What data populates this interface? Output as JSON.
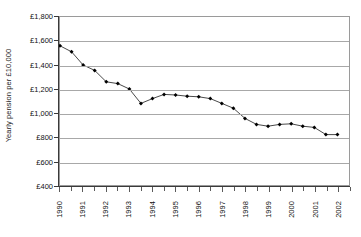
{
  "chart_data": {
    "type": "line",
    "title": "",
    "xlabel": "",
    "ylabel": "Yearly pension per £10,000",
    "ylim": [
      400,
      1800
    ],
    "ytick_labels": [
      "£1,800",
      "£1,600",
      "£1,400",
      "£1,200",
      "£1,000",
      "£800",
      "£600",
      "£400"
    ],
    "ytick_values": [
      1800,
      1600,
      1400,
      1200,
      1000,
      800,
      600,
      400
    ],
    "xtick_labels": [
      "1990",
      "1991",
      "1992",
      "1993",
      "1994",
      "1995",
      "1996",
      "1997",
      "1998",
      "1999",
      "2000",
      "2001",
      "2002"
    ],
    "xlim": [
      1990.0,
      2002.5
    ],
    "grid": "horizontal",
    "legend": "none",
    "marker": "filled-diamond",
    "line_color": "#333333",
    "marker_color": "#000000",
    "grid_color": "#a8a8a8",
    "x": [
      1990.0,
      1990.5,
      1991.0,
      1991.5,
      1992.0,
      1992.5,
      1993.0,
      1993.5,
      1994.0,
      1994.5,
      1995.0,
      1995.5,
      1996.0,
      1996.5,
      1997.0,
      1997.5,
      1998.0,
      1998.5,
      1999.0,
      1999.5,
      2000.0,
      2000.5,
      2001.0,
      2001.5,
      2002.0
    ],
    "values": [
      1560,
      1510,
      1400,
      1355,
      1260,
      1245,
      1200,
      1080,
      1120,
      1155,
      1150,
      1140,
      1135,
      1120,
      1080,
      1040,
      955,
      905,
      890,
      905,
      910,
      890,
      880,
      820,
      820
    ],
    "series": [
      {
        "name": "Yearly pension per £10,000",
        "values": [
          1560,
          1510,
          1400,
          1355,
          1260,
          1245,
          1200,
          1080,
          1120,
          1155,
          1150,
          1140,
          1135,
          1120,
          1080,
          1040,
          955,
          905,
          890,
          905,
          910,
          890,
          880,
          820,
          820
        ]
      }
    ]
  }
}
